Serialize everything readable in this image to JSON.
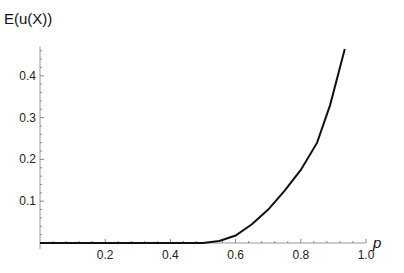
{
  "chart_data": {
    "type": "line",
    "title": "",
    "xlabel": "p",
    "ylabel": "E(u(X))",
    "xlim": [
      0,
      1.0
    ],
    "ylim": [
      0,
      0.47
    ],
    "grid": false,
    "legend": null,
    "x_ticks": [
      "0.2",
      "0.4",
      "0.6",
      "0.8",
      "1.0"
    ],
    "y_ticks": [
      "0.1",
      "0.2",
      "0.3",
      "0.4"
    ],
    "series": [
      {
        "name": "E(u(X))",
        "color": "#111111",
        "x": [
          0.0,
          0.1,
          0.2,
          0.3,
          0.4,
          0.5,
          0.55,
          0.6,
          0.65,
          0.7,
          0.75,
          0.8,
          0.85,
          0.89,
          0.935
        ],
        "y": [
          0.0,
          0.0,
          0.0,
          0.0,
          0.0,
          0.0,
          0.005,
          0.018,
          0.045,
          0.08,
          0.125,
          0.175,
          0.24,
          0.33,
          0.464
        ]
      }
    ]
  }
}
